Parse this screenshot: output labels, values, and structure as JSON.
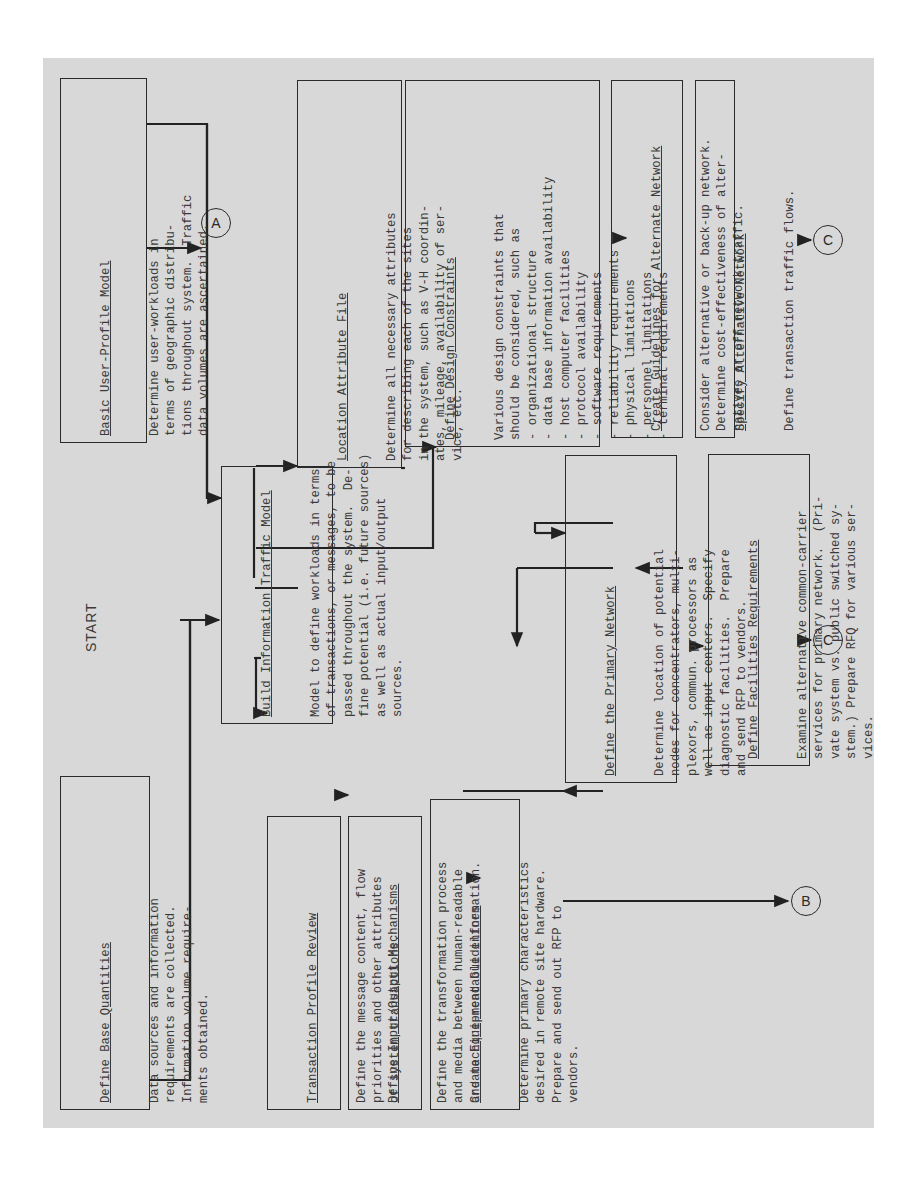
{
  "start_label": "START",
  "connectors": {
    "a": "A",
    "b": "B",
    "c1": "C",
    "c2": "C"
  },
  "boxes": {
    "define_base_quantities": {
      "title": "Define Base Quantities",
      "body": "Data sources and information\nrequirements are collected.\nInformation volume require-\nments obtained."
    },
    "basic_user_profile_model": {
      "title": "Basic User-Profile Model",
      "body": "Determine user-workloads in\nterms of geographic distribu-\ntions throughout system.  Traffic\ndata volumes are ascertained."
    },
    "build_information_traffic_model": {
      "title": "Build Information Traffic Model",
      "body": "Model to define workloads in terms\nof transactions, or messages, to be\npassed throughout the system.  De-\nfine potential (i.e. future sources)\nas well as actual input/output\nsources."
    },
    "transaction_profile_review": {
      "title": "Transaction Profile Review",
      "body": "Define the message content, flow\npriorities and other attributes\nof system transactions."
    },
    "define_io_mechanisms": {
      "title": "Define Input/Output Mechanisms",
      "body": "Define the transformation process\nand media between human-readable\nand machine-readable information."
    },
    "create_equipment_guidelines": {
      "title": "Create Equipment Guidelines",
      "body": "Determine primary characteristics\ndesired in remote site hardware.\nPrepare and send out RFP to\nvendors."
    },
    "location_attribute_file": {
      "title": "Location Attribute File",
      "body": "Determine all necessary attributes\nfor describing each of the sites\nin the system, such as V-H coordin-\nates, mileage, availability of ser-\nvice, etc."
    },
    "define_design_constraints": {
      "title": "Define Design Constraints",
      "body": "Various design constraints that\nshould be considered, such as\n- organizational structure\n- data base information availability\n- host computer facilities\n- protocol availability\n- software requirements\n- reliability requirements\n- physical limitations\n- personnel limitations\n- terminal requirements"
    },
    "define_primary_network": {
      "title": "Define the Primary Network",
      "body": "Determine location of potential\nnodes for concentrators, multi-\nplexors, commun. processors as\nwell as input centers.  Specify\ndiagnostic facilities.  Prepare\nand send RFP to vendors."
    },
    "create_guidelines_alternate_network": {
      "title": "Create Guidelines for Alternate Network",
      "body": "Consider alternative or back-up network.\nDetermine cost-effectiveness of alter-\nnatives or off-network traffic."
    },
    "specify_alternative_network": {
      "title": "Specify Alternative Network",
      "body": "Define transaction traffic flows."
    },
    "define_facilities_requirements": {
      "title": "Define Facilities Requirements",
      "body": "Examine alternative common-carrier\nservices for primary network.  (Pri-\nvate system vs. public switched sy-\nstem.) Prepare RFQ for various ser-\nvices."
    }
  }
}
